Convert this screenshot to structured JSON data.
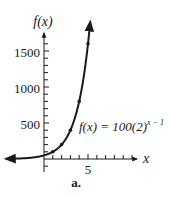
{
  "chart_data": {
    "type": "line",
    "title": "",
    "caption": "a.",
    "xlabel": "x",
    "ylabel": "f(x)",
    "equation_label": {
      "lhs": "f(x) = 100(2)",
      "exponent": "x − 1"
    },
    "x_tick_labels": [
      "5"
    ],
    "y_tick_labels": [
      "500",
      "1000",
      "1500"
    ],
    "y_ticks_step": 100,
    "x_ticks_step": 1,
    "xlim": [
      -4,
      10
    ],
    "ylim": [
      -150,
      1750
    ],
    "grid": false,
    "legend": "none",
    "series": [
      {
        "name": "f(x) = 100(2)^(x − 1)",
        "x": [
          0,
          1,
          2,
          3,
          4,
          5
        ],
        "values": [
          50,
          100,
          200,
          400,
          800,
          1600
        ],
        "marked_points": true,
        "arrows_both_ends": true
      }
    ]
  },
  "axes": {
    "y_axis_label": "f(x)",
    "x_axis_label": "x",
    "tick_5": "5",
    "tick_500": "500",
    "tick_1000": "1000",
    "tick_1500": "1500"
  },
  "caption": "a.",
  "colors": {
    "ink": "#1a1a1a",
    "background": "#ffffff"
  }
}
